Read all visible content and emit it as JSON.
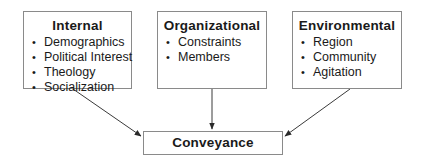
{
  "diagram": {
    "sources": [
      {
        "title": "Internal",
        "items": [
          "Demographics",
          "Political Interest",
          "Theology",
          "Socialization"
        ]
      },
      {
        "title": "Organizational",
        "items": [
          "Constraints",
          "Members"
        ]
      },
      {
        "title": "Environmental",
        "items": [
          "Region",
          "Community",
          "Agitation"
        ]
      }
    ],
    "target": {
      "title": "Conveyance"
    },
    "edges": [
      {
        "from": "Internal",
        "to": "Conveyance"
      },
      {
        "from": "Organizational",
        "to": "Conveyance"
      },
      {
        "from": "Environmental",
        "to": "Conveyance"
      }
    ],
    "colors": {
      "line": "#3a3a3a",
      "border": "#8a8a8a",
      "text": "#1a1a1a"
    }
  }
}
